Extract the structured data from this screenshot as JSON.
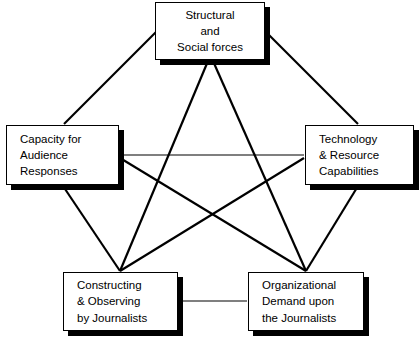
{
  "diagram": {
    "type": "pentagon-network",
    "background_color": "#ffffff",
    "line_color": "#000000",
    "box_fill": "#ffffff",
    "box_border_color": "#000000",
    "shadow_color": "#000000",
    "nodes": [
      {
        "id": "structural-social-forces",
        "label": "Structural\nand\nSocial forces",
        "align": "center",
        "x": 155,
        "y": 2,
        "width": 110,
        "height": 58
      },
      {
        "id": "capacity-audience-responses",
        "label": "Capacity for\nAudience\nResponses",
        "align": "left",
        "x": 6,
        "y": 125,
        "width": 113,
        "height": 60
      },
      {
        "id": "technology-resource-capabilities",
        "label": "Technology\n& Resource\nCapabilities",
        "align": "left",
        "x": 305,
        "y": 125,
        "width": 109,
        "height": 60
      },
      {
        "id": "constructing-observing-journalists",
        "label": "Constructing\n& Observing\nby Journalists",
        "align": "left",
        "x": 63,
        "y": 272,
        "width": 115,
        "height": 59
      },
      {
        "id": "organizational-demand-journalists",
        "label": "Organizational\nDemand upon\nthe Journalists",
        "align": "left",
        "x": 248,
        "y": 272,
        "width": 116,
        "height": 59
      }
    ],
    "edges": [
      {
        "id": "edge-top-left",
        "from": "structural-social-forces",
        "to": "capacity-audience-responses",
        "x1": 156,
        "y1": 32,
        "x2": 64,
        "y2": 124,
        "width": 2.2
      },
      {
        "id": "edge-top-right",
        "from": "structural-social-forces",
        "to": "technology-resource-capabilities",
        "x1": 266,
        "y1": 32,
        "x2": 358,
        "y2": 124,
        "width": 2.2
      },
      {
        "id": "edge-left-bottomleft",
        "from": "capacity-audience-responses",
        "to": "constructing-observing-journalists",
        "x1": 63,
        "y1": 186,
        "x2": 120,
        "y2": 271,
        "width": 2.2
      },
      {
        "id": "edge-right-bottomright",
        "from": "technology-resource-capabilities",
        "to": "organizational-demand-journalists",
        "x1": 358,
        "y1": 186,
        "x2": 306,
        "y2": 271,
        "width": 2.2
      },
      {
        "id": "edge-bottomleft-bottomright",
        "from": "constructing-observing-journalists",
        "to": "organizational-demand-journalists",
        "x1": 179,
        "y1": 301,
        "x2": 247,
        "y2": 301,
        "width": 1.1
      },
      {
        "id": "edge-top-bottomleft",
        "from": "structural-social-forces",
        "to": "constructing-observing-journalists",
        "x1": 208,
        "y1": 61,
        "x2": 120,
        "y2": 271,
        "width": 2.2
      },
      {
        "id": "edge-top-bottomright",
        "from": "structural-social-forces",
        "to": "organizational-demand-journalists",
        "x1": 213,
        "y1": 61,
        "x2": 306,
        "y2": 271,
        "width": 2.2
      },
      {
        "id": "edge-left-right",
        "from": "capacity-audience-responses",
        "to": "technology-resource-capabilities",
        "x1": 120,
        "y1": 155,
        "x2": 304,
        "y2": 155,
        "width": 1.1
      },
      {
        "id": "edge-left-bottomright",
        "from": "capacity-audience-responses",
        "to": "organizational-demand-journalists",
        "x1": 120,
        "y1": 158,
        "x2": 306,
        "y2": 271,
        "width": 2.2
      },
      {
        "id": "edge-right-bottomleft",
        "from": "technology-resource-capabilities",
        "to": "constructing-observing-journalists",
        "x1": 304,
        "y1": 158,
        "x2": 120,
        "y2": 271,
        "width": 2.2
      }
    ]
  }
}
